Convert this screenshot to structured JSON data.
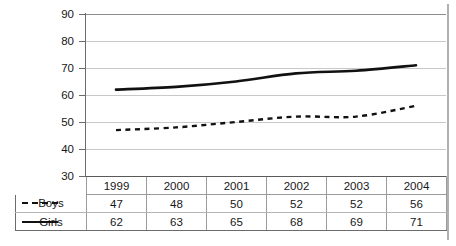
{
  "chart_data": {
    "type": "line",
    "title": "",
    "xlabel": "",
    "ylabel": "",
    "categories": [
      "1999",
      "2000",
      "2001",
      "2002",
      "2003",
      "2004"
    ],
    "series": [
      {
        "name": "Boys",
        "values": [
          47,
          48,
          50,
          52,
          52,
          56
        ],
        "style": "dashed",
        "color": "#111111"
      },
      {
        "name": "Girls",
        "values": [
          62,
          63,
          65,
          68,
          69,
          71
        ],
        "style": "solid",
        "color": "#111111"
      }
    ],
    "ylim": [
      30,
      90
    ],
    "ytick_values": [
      90,
      80,
      70,
      60,
      50,
      40,
      30
    ],
    "ytick_labels": [
      "90",
      "80",
      "70",
      "60",
      "50",
      "40",
      "30"
    ],
    "grid": true,
    "legend_position": "table-left",
    "has_data_table": true
  },
  "table": {
    "legend_header": "",
    "year_headers": [
      "1999",
      "2000",
      "2001",
      "2002",
      "2003",
      "2004"
    ],
    "rows": [
      {
        "label": "Boys",
        "marker": "dashed",
        "values": [
          "47",
          "48",
          "50",
          "52",
          "52",
          "56"
        ]
      },
      {
        "label": "Girls",
        "marker": "solid",
        "values": [
          "62",
          "63",
          "65",
          "68",
          "69",
          "71"
        ]
      }
    ]
  },
  "axis": {
    "y_labels": [
      "90",
      "80",
      "70",
      "60",
      "50",
      "40",
      "30"
    ]
  },
  "colors": {
    "series_line": "#111111",
    "gridline": "#c8c8c8",
    "axis": "#6b6b6b",
    "table_border": "#9b9b9b",
    "background": "#ffffff",
    "page_rule": "#b0b0b0"
  }
}
